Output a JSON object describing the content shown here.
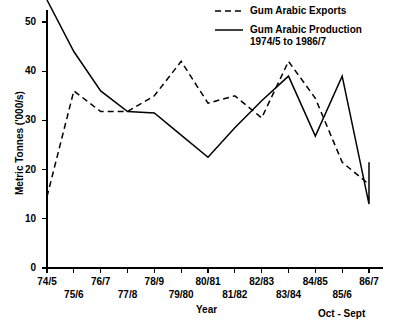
{
  "chart_data": {
    "type": "line",
    "title": "",
    "xlabel": "Year",
    "ylabel": "Metric Tonnes ('000/s)",
    "x_note": "Oct - Sept",
    "categories": [
      "74/5",
      "75/6",
      "76/7",
      "77/8",
      "78/9",
      "79/80",
      "80/81",
      "81/82",
      "82/83",
      "83/84",
      "84/85",
      "85/6",
      "86/7"
    ],
    "xlim": [
      0,
      12
    ],
    "ylim": [
      0,
      55
    ],
    "yticks": [
      0,
      10,
      20,
      30,
      40,
      50
    ],
    "ytick_labels": [
      "0",
      "10",
      "20",
      "30",
      "40",
      "50"
    ],
    "grid": false,
    "legend_position": "top-right",
    "series": [
      {
        "name": "Gum Arabic Exports",
        "style": "dashed",
        "values": [
          14.5,
          36.0,
          31.8,
          31.8,
          35.0,
          42.0,
          33.5,
          35.0,
          30.5,
          42.0,
          34.5,
          21.5,
          17.0
        ]
      },
      {
        "name": "Gum Arabic Production 1974/5 to 1986/7",
        "style": "solid",
        "values": [
          54.5,
          44.0,
          36.0,
          31.8,
          31.5,
          27.0,
          22.5,
          28.5,
          34.0,
          39.0,
          26.8,
          39.0,
          13.0
        ]
      }
    ],
    "series_tail": {
      "solid_extra": [
        17.0,
        21.5
      ],
      "note": "solid series continues past 84/85 rising to 21.5 at 86/7"
    }
  },
  "legend": {
    "entries": [
      {
        "label": "Gum Arabic Exports",
        "style": "dashed"
      },
      {
        "label": "Gum Arabic Production",
        "label2": "1974/5 to 1986/7",
        "style": "solid"
      }
    ]
  },
  "axis": {
    "y_title": "Metric Tonnes ('000/s)",
    "x_title": "Year",
    "footnote": "Oct - Sept",
    "ytick_labels": [
      "0",
      "10",
      "20",
      "30",
      "40",
      "50"
    ],
    "xtick_labels": [
      "74/5",
      "75/6",
      "76/7",
      "77/8",
      "78/9",
      "79/80",
      "80/81",
      "81/82",
      "82/83",
      "83/84",
      "84/85",
      "85/6",
      "86/7"
    ]
  }
}
